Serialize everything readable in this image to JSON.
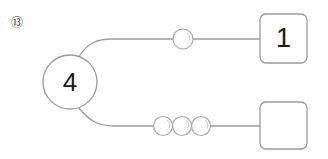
{
  "problem": {
    "number_label": "⑬"
  },
  "diagram": {
    "source_node": {
      "value": "4",
      "shape": "circle"
    },
    "branches": [
      {
        "beads": 1,
        "target_box": {
          "value": "1"
        }
      },
      {
        "beads": 3,
        "target_box": {
          "value": ""
        }
      }
    ],
    "colors": {
      "stroke": "#9a9a9a",
      "text": "#1a1a1a"
    }
  }
}
